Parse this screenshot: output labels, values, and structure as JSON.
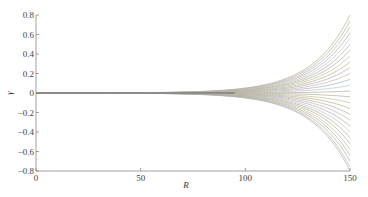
{
  "chart_data": {
    "type": "line",
    "title": "",
    "xlabel": "R",
    "ylabel": "γ",
    "xlim": [
      0,
      150
    ],
    "ylim": [
      -0.8,
      0.8
    ],
    "xticks": [
      0,
      50,
      100,
      150
    ],
    "xtick_labels": [
      "0",
      "50",
      "100",
      "150"
    ],
    "yticks": [
      0.8,
      0.6,
      0.4,
      0.2,
      0,
      -0.2,
      -0.4,
      -0.6,
      -0.8
    ],
    "ytick_labels": [
      "0.8",
      "0.6",
      "0.4",
      "0.2",
      "0",
      "−0.2",
      "−0.4",
      "−0.6",
      "−0.8"
    ],
    "grid": false,
    "legend": null,
    "growth_rate": 0.055,
    "series_endpoints_at_R150": [
      0.8,
      0.74,
      0.68,
      0.62,
      0.56,
      0.5,
      0.44,
      0.38,
      0.32,
      0.26,
      0.2,
      0.14,
      0.08,
      0.02,
      -0.04,
      -0.1,
      -0.16,
      -0.22,
      -0.28,
      -0.34,
      -0.4,
      -0.46,
      -0.52,
      -0.58,
      -0.64,
      -0.7,
      -0.76,
      -0.8
    ],
    "series_colors": [
      "#b9b27a",
      "#a9a9c4",
      "#c9b48f",
      "#9fb0c8",
      "#c2c2c2",
      "#b8a89a",
      "#a3b39c",
      "#c7bca0"
    ]
  }
}
